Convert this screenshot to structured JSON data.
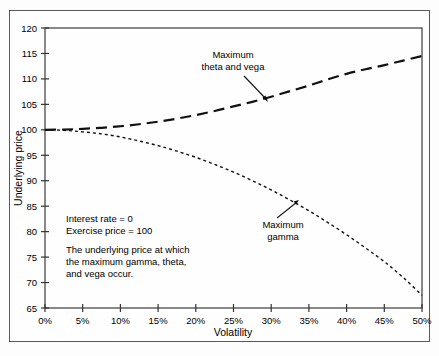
{
  "figure": {
    "background": "#fefefe",
    "border_color": "#5a5a5a"
  },
  "axes": {
    "x_title": "Volatility",
    "y_title": "Underlying price",
    "x_ticks": [
      "0%",
      "5%",
      "10%",
      "15%",
      "20%",
      "25%",
      "30%",
      "35%",
      "40%",
      "45%",
      "50%"
    ],
    "y_ticks": [
      "120",
      "115",
      "110",
      "105",
      "100",
      "95",
      "90",
      "85",
      "80",
      "75",
      "70",
      "65"
    ]
  },
  "annotations": {
    "upper_label_line1": "Maximum",
    "upper_label_line2": "theta and vega",
    "lower_label_line1": "Maximum",
    "lower_label_line2": "gamma"
  },
  "note_block": {
    "line1": "Interest rate = 0",
    "line2": "Exercise price = 100",
    "line3": "The underlying price at which",
    "line4": "the maximum gamma, theta,",
    "line5": "and vega occur."
  },
  "chart_data": {
    "type": "line",
    "title": "",
    "xlabel": "Volatility",
    "ylabel": "Underlying price",
    "xlim": [
      0,
      50
    ],
    "ylim": [
      65,
      120
    ],
    "xtick_values": [
      0,
      5,
      10,
      15,
      20,
      25,
      30,
      35,
      40,
      45,
      50
    ],
    "ytick_values": [
      65,
      70,
      75,
      80,
      85,
      90,
      95,
      100,
      105,
      110,
      115,
      120
    ],
    "grid": false,
    "legend": "none",
    "x": [
      0,
      2.5,
      5,
      7.5,
      10,
      12.5,
      15,
      17.5,
      20,
      22.5,
      25,
      27.5,
      30,
      32.5,
      35,
      37.5,
      40,
      42.5,
      45,
      47.5,
      50
    ],
    "series": [
      {
        "name": "Maximum theta and vega",
        "style": "long-dash",
        "stroke_width": 2.2,
        "color": "#111111",
        "values": [
          100.0,
          100.05,
          100.2,
          100.4,
          100.7,
          101.1,
          101.6,
          102.2,
          102.9,
          103.7,
          104.6,
          105.5,
          106.5,
          107.6,
          108.7,
          109.9,
          111.0,
          111.9,
          112.7,
          113.6,
          114.5
        ]
      },
      {
        "name": "Maximum gamma",
        "style": "short-dot",
        "stroke_width": 1.4,
        "color": "#111111",
        "values": [
          100.0,
          99.9,
          99.6,
          99.2,
          98.6,
          97.8,
          96.9,
          95.8,
          94.6,
          93.2,
          91.7,
          90.0,
          88.2,
          86.2,
          84.1,
          81.8,
          79.4,
          76.8,
          74.1,
          71.0,
          67.5
        ]
      }
    ],
    "annotation_points": [
      {
        "label": "Maximum theta and vega",
        "x": 30.0,
        "y": 105.4
      },
      {
        "label": "Maximum gamma",
        "x": 33.2,
        "y": 84.0
      }
    ],
    "text_notes": [
      "Interest rate = 0",
      "Exercise price = 100",
      "The underlying price at which the maximum gamma, theta, and vega occur."
    ]
  }
}
